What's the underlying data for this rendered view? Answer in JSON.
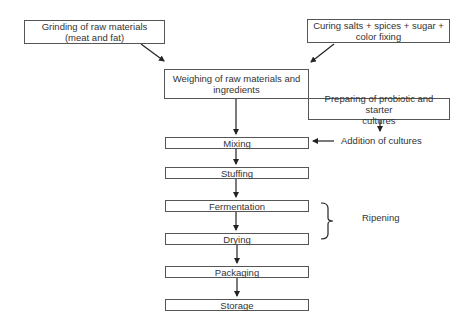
{
  "diagram": {
    "type": "process-flowchart",
    "inputs": {
      "left": "Grinding of raw materials (meat and fat)",
      "left_line1": "Grinding of raw materials",
      "left_line2": "(meat and fat)",
      "right_line1": "Curing salts + spices + sugar +",
      "right_line2": "color fixing"
    },
    "weighing": {
      "line1": "Weighing of raw materials and",
      "line2": "ingredients"
    },
    "cultures": {
      "prepare_line1": "Preparing of probiotic and starter",
      "prepare_line2": "cultures",
      "addition": "Addition of cultures"
    },
    "steps": [
      {
        "id": "mixing",
        "label": "Mixing"
      },
      {
        "id": "stuffing",
        "label": "Stuffing"
      },
      {
        "id": "fermentation",
        "label": "Fermentation"
      },
      {
        "id": "drying",
        "label": "Drying"
      },
      {
        "id": "packaging",
        "label": "Packaging"
      },
      {
        "id": "storage",
        "label": "Storage"
      }
    ],
    "group": {
      "label": "Ripening",
      "members": [
        "Fermentation",
        "Drying"
      ]
    },
    "colors": {
      "line": "#222222",
      "box_border": "#555555",
      "text": "#333333",
      "background": "#ffffff"
    }
  }
}
